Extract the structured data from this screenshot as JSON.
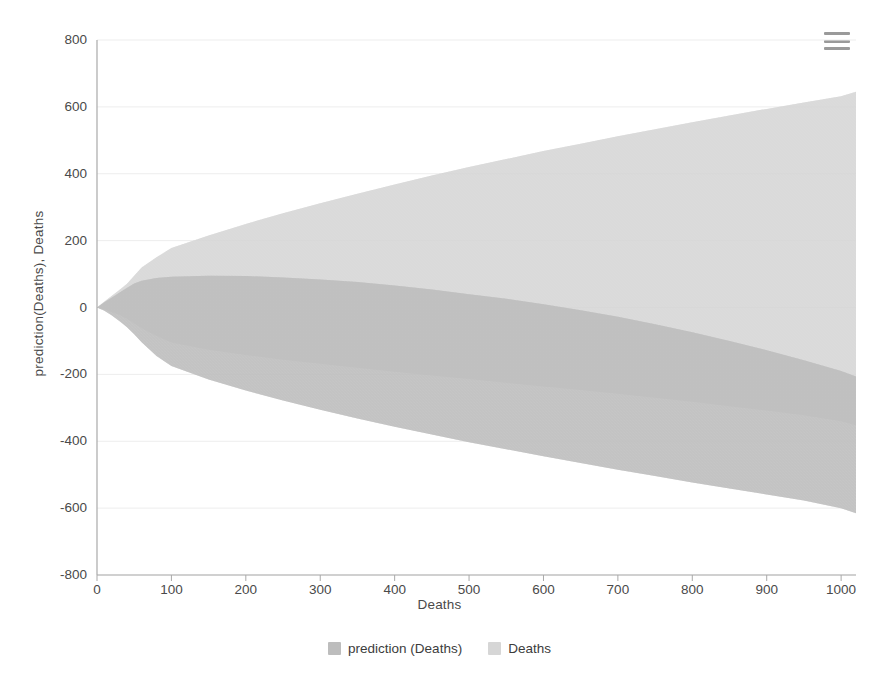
{
  "chart_data": {
    "type": "area",
    "title": "",
    "xlabel": "Deaths",
    "ylabel": "prediction(Deaths), Deaths",
    "xlim": [
      0,
      1020
    ],
    "ylim": [
      -800,
      800
    ],
    "xticks": [
      0,
      100,
      200,
      300,
      400,
      500,
      600,
      700,
      800,
      900,
      1000
    ],
    "yticks": [
      800,
      600,
      400,
      200,
      0,
      -200,
      -400,
      -600,
      -800
    ],
    "grid": true,
    "legend_position": "bottom",
    "legend": [
      "prediction (Deaths)",
      "Deaths"
    ],
    "series": [
      {
        "name": "Deaths",
        "kind": "band",
        "color": "#d6d6d6",
        "x": [
          0,
          10,
          20,
          30,
          40,
          50,
          60,
          80,
          100,
          150,
          200,
          250,
          300,
          350,
          400,
          450,
          500,
          550,
          600,
          650,
          700,
          750,
          800,
          850,
          900,
          950,
          1000,
          1020
        ],
        "upper": [
          0,
          18,
          35,
          52,
          70,
          95,
          120,
          150,
          178,
          215,
          250,
          282,
          312,
          340,
          368,
          395,
          420,
          444,
          468,
          490,
          512,
          533,
          554,
          574,
          594,
          613,
          632,
          645
        ],
        "lower": [
          0,
          -6,
          -14,
          -22,
          -34,
          -48,
          -62,
          -85,
          -105,
          -126,
          -142,
          -156,
          -168,
          -180,
          -192,
          -203,
          -214,
          -225,
          -236,
          -247,
          -258,
          -270,
          -282,
          -295,
          -308,
          -322,
          -340,
          -352
        ]
      },
      {
        "name": "prediction (Deaths)",
        "kind": "band",
        "color": "#bdbdbd",
        "x": [
          0,
          10,
          20,
          30,
          40,
          50,
          60,
          80,
          100,
          150,
          200,
          250,
          300,
          350,
          400,
          450,
          500,
          550,
          600,
          650,
          700,
          750,
          800,
          850,
          900,
          950,
          1000,
          1020
        ],
        "upper": [
          0,
          16,
          30,
          44,
          58,
          72,
          80,
          88,
          92,
          95,
          94,
          90,
          84,
          76,
          66,
          54,
          40,
          26,
          10,
          -8,
          -28,
          -50,
          -74,
          -100,
          -128,
          -158,
          -190,
          -206
        ],
        "lower": [
          0,
          -10,
          -24,
          -40,
          -58,
          -80,
          -104,
          -145,
          -175,
          -215,
          -248,
          -278,
          -306,
          -332,
          -357,
          -380,
          -403,
          -424,
          -445,
          -465,
          -485,
          -504,
          -523,
          -541,
          -559,
          -577,
          -600,
          -615
        ]
      }
    ],
    "overlap_color": "#c6c6c6"
  },
  "toolbar": {
    "menu_label": "chart-menu"
  }
}
